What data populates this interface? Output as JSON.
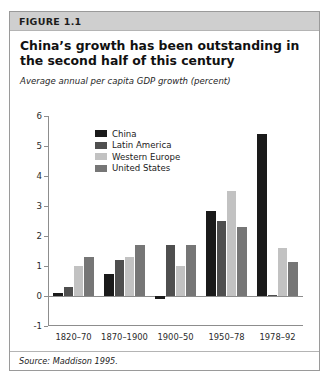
{
  "figure": {
    "header_label": "FIGURE 1.1",
    "title": "China’s growth has been outstanding in the second half of this century",
    "subtitle": "Average annual per capita GDP growth (percent)",
    "source": "Source: Maddison 1995."
  },
  "colors": {
    "china": "#1a1a1a",
    "latin_america": "#4f4f4f",
    "western_europe": "#c2c2c2",
    "united_states": "#767676",
    "header_band": "#cfcfcf",
    "axis": "#8d8d8d",
    "border": "#9a9a9a"
  },
  "chart_data": {
    "type": "bar",
    "title": "China’s growth has been outstanding in the second half of this century",
    "subtitle": "Average annual per capita GDP growth (percent)",
    "xlabel": "",
    "ylabel": "",
    "ylim": [
      -1,
      6
    ],
    "yticks": [
      -1,
      0,
      1,
      2,
      3,
      4,
      5,
      6
    ],
    "ytick_labels": [
      "-1",
      "0",
      "1",
      "2",
      "3",
      "4",
      "5",
      "6"
    ],
    "grid": false,
    "legend_position": "upper-left",
    "categories": [
      "1820–70",
      "1870–1900",
      "1900–50",
      "1950–78",
      "1978–92"
    ],
    "series": [
      {
        "name": "China",
        "color": "#1a1a1a",
        "values": [
          0.1,
          0.75,
          -0.1,
          2.85,
          5.4
        ]
      },
      {
        "name": "Latin America",
        "color": "#4f4f4f",
        "values": [
          0.3,
          1.2,
          1.7,
          2.5,
          0.05
        ]
      },
      {
        "name": "Western Europe",
        "color": "#c2c2c2",
        "values": [
          1.0,
          1.3,
          1.0,
          3.5,
          1.6
        ]
      },
      {
        "name": "United States",
        "color": "#767676",
        "values": [
          1.3,
          1.7,
          1.7,
          2.3,
          1.15
        ]
      }
    ],
    "source": "Source: Maddison 1995."
  }
}
